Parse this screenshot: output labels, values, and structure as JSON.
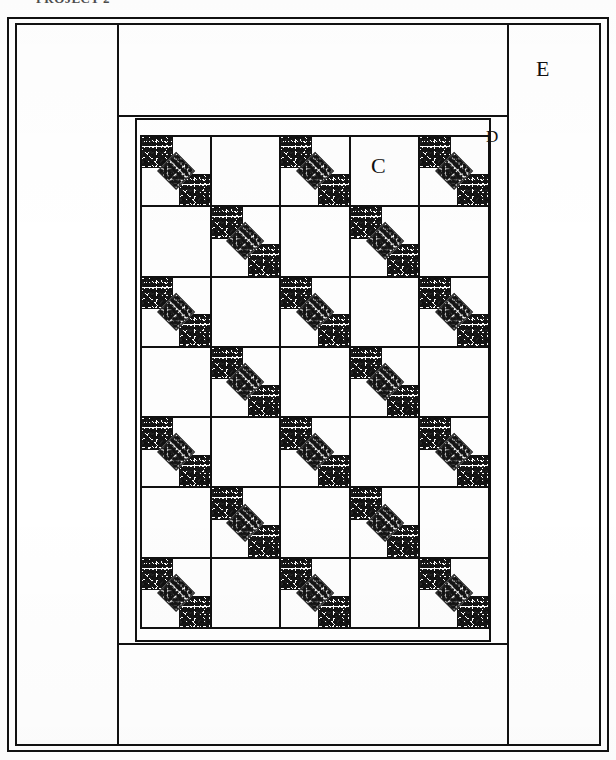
{
  "caption": {
    "text": "PROJECT 2"
  },
  "diagram": {
    "type": "quilt-layout-schematic",
    "title_labels": [
      {
        "id": "C",
        "text": "C",
        "refers_to": "alternate plain block"
      },
      {
        "id": "D",
        "text": "D",
        "refers_to": "inner narrow border"
      },
      {
        "id": "E",
        "text": "E",
        "refers_to": "outer wide border"
      }
    ],
    "grid": {
      "rows": 7,
      "columns": 5,
      "pieced_block_name": "diagonal chain block",
      "alternate_block_label": "C",
      "layout": [
        [
          "pieced",
          "plain",
          "pieced",
          "plain",
          "pieced"
        ],
        [
          "plain",
          "pieced",
          "plain",
          "pieced",
          "plain"
        ],
        [
          "pieced",
          "plain",
          "pieced",
          "plain",
          "pieced"
        ],
        [
          "plain",
          "pieced",
          "plain",
          "pieced",
          "plain"
        ],
        [
          "pieced",
          "plain",
          "pieced",
          "plain",
          "pieced"
        ],
        [
          "plain",
          "pieced",
          "plain",
          "pieced",
          "plain"
        ],
        [
          "pieced",
          "plain",
          "pieced",
          "plain",
          "pieced"
        ]
      ]
    },
    "borders": [
      {
        "label": "D",
        "position": "inner",
        "width": "narrow"
      },
      {
        "label": "E",
        "position": "outer",
        "width": "wide"
      }
    ],
    "colors": {
      "line": "#111111",
      "background": "#ffffff",
      "print_fabric": "#141414"
    }
  },
  "labels": {
    "C": "C",
    "D": "D",
    "E": "E"
  }
}
